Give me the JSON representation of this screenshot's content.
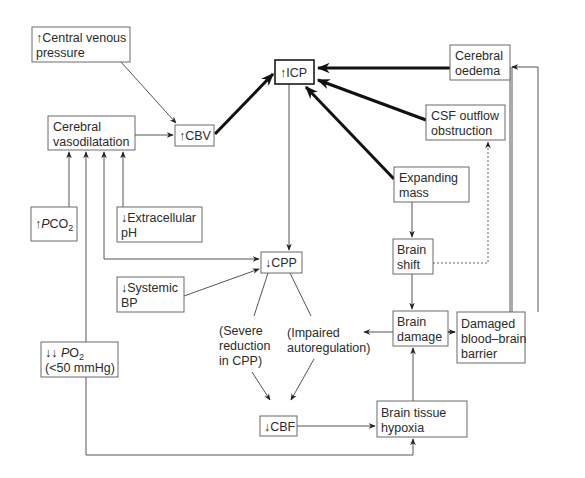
{
  "diagram": {
    "type": "flowchart",
    "nodes": {
      "cvp": {
        "lines": [
          "↑Central venous",
          "pressure"
        ]
      },
      "vasodilatation": {
        "lines": [
          "Cerebral",
          "vasodilatation"
        ]
      },
      "cbv": {
        "lines": [
          "↑CBV"
        ]
      },
      "icp": {
        "lines": [
          "↑ICP"
        ]
      },
      "oedema": {
        "lines": [
          "Cerebral",
          "oedema"
        ]
      },
      "csf": {
        "lines": [
          "CSF outflow",
          "obstruction"
        ]
      },
      "pco2": {
        "prefix": "↑",
        "italic": "P",
        "main": "CO",
        "sub": "2"
      },
      "ph": {
        "lines": [
          "↓Extracellular",
          "pH"
        ]
      },
      "mass": {
        "lines": [
          "Expanding",
          "mass"
        ]
      },
      "cpp": {
        "lines": [
          "↓CPP"
        ]
      },
      "shift": {
        "lines": [
          "Brain",
          "shift"
        ]
      },
      "bp": {
        "lines": [
          "↓Systemic",
          "BP"
        ]
      },
      "damage": {
        "lines": [
          "Brain",
          "damage"
        ]
      },
      "bbb": {
        "lines": [
          "Damaged",
          "blood–brain",
          "barrier"
        ]
      },
      "po2": {
        "prefix": "↓↓ ",
        "italic": "P",
        "main": "O",
        "sub": "2",
        "line2": "(<50 mmHg)"
      },
      "cbf": {
        "lines": [
          "↓CBF"
        ]
      },
      "hypoxia": {
        "lines": [
          "Brain tissue",
          "hypoxia"
        ]
      }
    },
    "labels": {
      "severe": [
        "(Severe",
        "reduction",
        "in CPP)"
      ],
      "impaired": [
        "(Impaired",
        "autoregulation)"
      ]
    },
    "edges": [
      {
        "from": "cvp",
        "to": "cbv",
        "style": "thin"
      },
      {
        "from": "vasodilatation",
        "to": "cbv",
        "style": "thin"
      },
      {
        "from": "cbv",
        "to": "icp",
        "style": "thick"
      },
      {
        "from": "oedema",
        "to": "icp",
        "style": "thick"
      },
      {
        "from": "csf",
        "to": "icp",
        "style": "thick"
      },
      {
        "from": "mass",
        "to": "icp",
        "style": "thick"
      },
      {
        "from": "pco2",
        "to": "vasodilatation",
        "style": "thin"
      },
      {
        "from": "ph",
        "to": "vasodilatation",
        "style": "thin"
      },
      {
        "from": "cpp",
        "to": "vasodilatation",
        "style": "thin"
      },
      {
        "from": "vasodilatation",
        "to": "cpp",
        "style": "thin"
      },
      {
        "from": "po2",
        "to": "vasodilatation",
        "style": "thin"
      },
      {
        "from": "icp",
        "to": "cpp",
        "style": "thin"
      },
      {
        "from": "bp",
        "to": "cpp",
        "style": "thin"
      },
      {
        "from": "mass",
        "to": "shift",
        "style": "thin"
      },
      {
        "from": "shift",
        "to": "csf",
        "style": "dotted"
      },
      {
        "from": "shift",
        "to": "damage",
        "style": "thin"
      },
      {
        "from": "damage",
        "to": "bbb",
        "style": "medium"
      },
      {
        "from": "damage",
        "to": "impaired",
        "style": "thin"
      },
      {
        "from": "bbb",
        "to": "oedema",
        "style": "thin"
      },
      {
        "from": "cpp",
        "to": "cbf",
        "via": "severe",
        "style": "thin"
      },
      {
        "from": "cpp",
        "to": "cbf",
        "via": "impaired",
        "style": "thin"
      },
      {
        "from": "cbf",
        "to": "hypoxia",
        "style": "thin"
      },
      {
        "from": "po2",
        "to": "hypoxia",
        "style": "thin"
      },
      {
        "from": "hypoxia",
        "to": "damage",
        "style": "thin"
      }
    ]
  }
}
